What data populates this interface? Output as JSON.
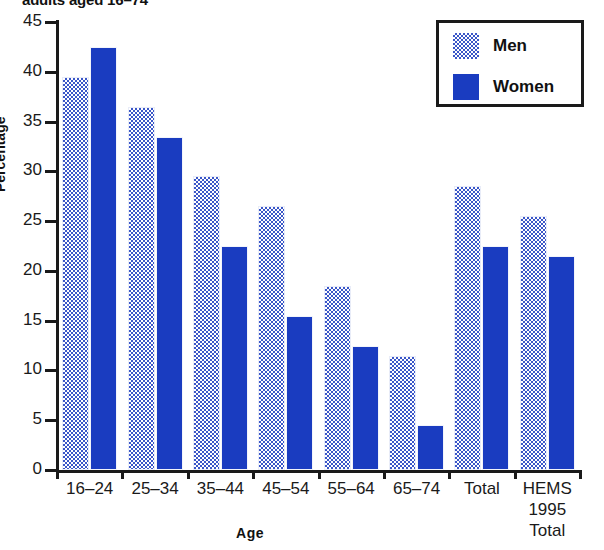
{
  "chart_data": {
    "type": "bar",
    "title": "adults aged 16–74",
    "xlabel": "Age",
    "ylabel": "Percentage",
    "ylim": [
      0,
      45
    ],
    "ytick_step": 5,
    "yticks": [
      "45",
      "40",
      "35",
      "30",
      "25",
      "20",
      "15",
      "10",
      "5",
      "0"
    ],
    "grid": false,
    "legend_position": "top-right",
    "categories": [
      "16–24",
      "25–34",
      "35–44",
      "45–54",
      "55–64",
      "65–74",
      "Total",
      "HEMS 1995 Total"
    ],
    "category_lines": [
      [
        "16–24"
      ],
      [
        "25–34"
      ],
      [
        "35–44"
      ],
      [
        "45–54"
      ],
      [
        "55–64"
      ],
      [
        "65–74"
      ],
      [
        "Total"
      ],
      [
        "HEMS",
        "1995",
        "Total"
      ]
    ],
    "series": [
      {
        "name": "Men",
        "color": "#3a56c8",
        "pattern": "dotted",
        "values": [
          39.5,
          36.5,
          29.5,
          26.5,
          18.5,
          11.5,
          28.5,
          25.5
        ]
      },
      {
        "name": "Women",
        "color": "#1a3cc0",
        "pattern": "solid",
        "values": [
          42.5,
          33.5,
          22.5,
          15.5,
          12.5,
          4.5,
          22.5,
          21.5
        ]
      }
    ]
  },
  "legend": {
    "items": [
      {
        "label": "Men"
      },
      {
        "label": "Women"
      }
    ]
  },
  "colors": {
    "men": "#3a56c8",
    "women": "#1a3cc0",
    "axis": "#1a1a1a",
    "background": "#ffffff"
  }
}
